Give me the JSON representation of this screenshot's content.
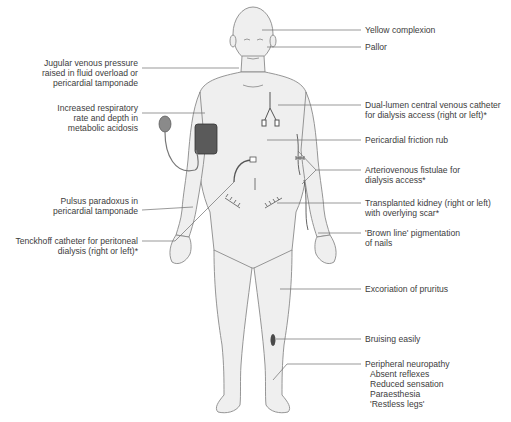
{
  "diagram": {
    "colors": {
      "skin": "#efefef",
      "outline": "#8a8a8a",
      "leader_line": "#6e6e6e",
      "cuff": "#5a5a5a",
      "bruise": "#4a4a4a",
      "text": "#3c3c3c"
    },
    "left_labels": [
      {
        "id": "jvp",
        "lines": [
          "Jugular venous pressure",
          "raised in fluid overload or",
          "pericardial tamponade"
        ]
      },
      {
        "id": "resp",
        "lines": [
          "Increased respiratory",
          "rate and depth in",
          "metabolic acidosis"
        ]
      },
      {
        "id": "pulsus",
        "lines": [
          "Pulsus paradoxus in",
          "pericardial tamponade"
        ]
      },
      {
        "id": "tenckhoff",
        "lines": [
          "Tenckhoff catheter for peritoneal",
          "dialysis (right or left)*"
        ]
      }
    ],
    "right_labels": [
      {
        "id": "yellow",
        "lines": [
          "Yellow complexion"
        ]
      },
      {
        "id": "pallor",
        "lines": [
          "Pallor"
        ]
      },
      {
        "id": "cvc",
        "lines": [
          "Dual-lumen central venous catheter",
          "for dialysis access (right or left)*"
        ]
      },
      {
        "id": "rub",
        "lines": [
          "Pericardial friction rub"
        ]
      },
      {
        "id": "avf",
        "lines": [
          "Arteriovenous fistulae for",
          "dialysis access*"
        ]
      },
      {
        "id": "kidney",
        "lines": [
          "Transplanted kidney (right or left)",
          "with overlying scar*"
        ]
      },
      {
        "id": "nails",
        "lines": [
          "'Brown line' pigmentation",
          "of nails"
        ]
      },
      {
        "id": "pruritus",
        "lines": [
          "Excoriation of pruritus"
        ]
      },
      {
        "id": "bruising",
        "lines": [
          "Bruising easily"
        ]
      },
      {
        "id": "neuro",
        "lines": [
          "Peripheral neuropathy"
        ],
        "sub": [
          "Absent reflexes",
          "Reduced sensation",
          "Paraesthesia",
          "'Restless legs'"
        ]
      }
    ]
  }
}
